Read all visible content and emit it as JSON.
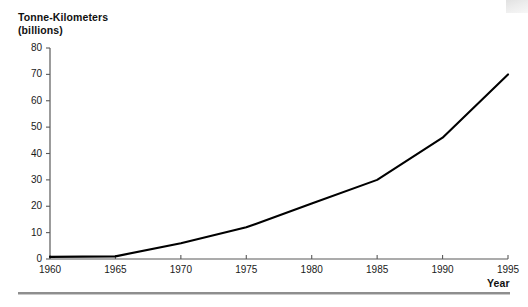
{
  "figure": {
    "y_axis_title_line1": "Tonne-Kilometers",
    "y_axis_title_line2": "(billions)",
    "x_axis_title": "Year",
    "line_color": "#000000",
    "axis_color": "#595959",
    "rule_color": "#8e8e8e"
  },
  "chart_data": {
    "type": "line",
    "title": "",
    "subtitle": "",
    "xlabel": "Year",
    "ylabel": "Tonne-Kilometers (billions)",
    "x": [
      1960,
      1965,
      1970,
      1975,
      1980,
      1985,
      1990,
      1995
    ],
    "values": [
      0.8,
      1.0,
      6.0,
      12.0,
      21.0,
      30.0,
      46.0,
      70.0
    ],
    "xlim": [
      1960,
      1995
    ],
    "ylim": [
      0,
      80
    ],
    "xticks": [
      1960,
      1965,
      1970,
      1975,
      1980,
      1985,
      1990,
      1995
    ],
    "xtick_labels": [
      "1960",
      "1965",
      "1970",
      "1975",
      "1980",
      "1985",
      "1990",
      "1995"
    ],
    "yticks": [
      0,
      10,
      20,
      30,
      40,
      50,
      60,
      70,
      80
    ],
    "ytick_labels": [
      "0",
      "10",
      "20",
      "30",
      "40",
      "50",
      "60",
      "70",
      "80"
    ],
    "grid": false,
    "legend": false,
    "legend_position": "none",
    "series": [
      {
        "name": "Tonne-Kilometers",
        "values": [
          0.8,
          1.0,
          6.0,
          12.0,
          21.0,
          30.0,
          46.0,
          70.0
        ]
      }
    ]
  }
}
